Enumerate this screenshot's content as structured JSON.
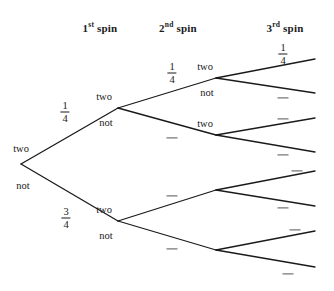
{
  "diagram": {
    "type": "probability-tree",
    "width": 334,
    "height": 291,
    "line_color": "#1a1a1a",
    "text_color": "#1a1a1a",
    "blank_color": "#555555",
    "background": "#ffffff"
  },
  "headers": [
    {
      "id": "h1",
      "ordinal": "1",
      "suffix": "st",
      "word": "spin",
      "x": 100,
      "y": 22
    },
    {
      "id": "h2",
      "ordinal": "2",
      "suffix": "nd",
      "word": "spin",
      "x": 178,
      "y": 22
    },
    {
      "id": "h3",
      "ordinal": "3",
      "suffix": "rd",
      "word": "spin",
      "x": 285,
      "y": 22
    }
  ],
  "nodes": [
    {
      "id": "root",
      "level": 0,
      "x": 21,
      "y": 164,
      "above": "two",
      "below": "not"
    },
    {
      "id": "n-t",
      "level": 1,
      "x": 118,
      "y": 108,
      "above": "two",
      "below": "not"
    },
    {
      "id": "n-n",
      "level": 1,
      "x": 118,
      "y": 221,
      "above": "two",
      "below": "not"
    },
    {
      "id": "n-tt",
      "level": 2,
      "x": 216,
      "y": 78,
      "above": "two",
      "below": "not"
    },
    {
      "id": "n-tn",
      "level": 2,
      "x": 216,
      "y": 135,
      "above": "two",
      "below": ""
    },
    {
      "id": "n-nt",
      "level": 2,
      "x": 216,
      "y": 190,
      "above": "",
      "below": ""
    },
    {
      "id": "n-nn",
      "level": 2,
      "x": 216,
      "y": 250,
      "above": "",
      "below": ""
    }
  ],
  "branches": [
    {
      "id": "b-t",
      "from": "root",
      "x1": 21,
      "y1": 164,
      "x2": 118,
      "y2": 108,
      "label": "1/4",
      "numerator": "1",
      "denominator": "4",
      "lx": 65,
      "ly": 112
    },
    {
      "id": "b-n",
      "from": "root",
      "x1": 21,
      "y1": 164,
      "x2": 118,
      "y2": 221,
      "label": "3/4",
      "numerator": "3",
      "denominator": "4",
      "lx": 66,
      "ly": 218
    },
    {
      "id": "b-tt",
      "from": "n-t",
      "x1": 118,
      "y1": 108,
      "x2": 216,
      "y2": 78,
      "label": "1/4",
      "numerator": "1",
      "denominator": "4",
      "lx": 172,
      "ly": 73
    },
    {
      "id": "b-tn",
      "from": "n-t",
      "x1": 118,
      "y1": 108,
      "x2": 216,
      "y2": 135,
      "label": "",
      "numerator": "",
      "denominator": "",
      "lx": 172,
      "ly": 138
    },
    {
      "id": "b-nt",
      "from": "n-n",
      "x1": 118,
      "y1": 221,
      "x2": 216,
      "y2": 190,
      "label": "",
      "numerator": "",
      "denominator": "",
      "lx": 172,
      "ly": 196
    },
    {
      "id": "b-nn",
      "from": "n-n",
      "x1": 118,
      "y1": 221,
      "x2": 216,
      "y2": 250,
      "label": "",
      "numerator": "",
      "denominator": "",
      "lx": 172,
      "ly": 249
    },
    {
      "id": "b-ttt",
      "from": "n-tt",
      "x1": 216,
      "y1": 78,
      "x2": 315,
      "y2": 59,
      "label": "1/4",
      "numerator": "1",
      "denominator": "4",
      "lx": 283,
      "ly": 54
    },
    {
      "id": "b-ttn",
      "from": "n-tt",
      "x1": 216,
      "y1": 78,
      "x2": 315,
      "y2": 93,
      "label": "",
      "numerator": "",
      "denominator": "",
      "lx": 283,
      "ly": 98
    },
    {
      "id": "b-tnt",
      "from": "n-tn",
      "x1": 216,
      "y1": 135,
      "x2": 315,
      "y2": 118,
      "label": "",
      "numerator": "",
      "denominator": "",
      "lx": 283,
      "ly": 119
    },
    {
      "id": "b-tnn",
      "from": "n-tn",
      "x1": 216,
      "y1": 135,
      "x2": 315,
      "y2": 152,
      "label": "",
      "numerator": "",
      "denominator": "",
      "lx": 283,
      "ly": 155
    },
    {
      "id": "b-ntt",
      "from": "n-nt",
      "x1": 216,
      "y1": 190,
      "x2": 315,
      "y2": 171,
      "label": "",
      "numerator": "",
      "denominator": "",
      "lx": 297,
      "ly": 171
    },
    {
      "id": "b-ntn",
      "from": "n-nt",
      "x1": 216,
      "y1": 190,
      "x2": 315,
      "y2": 206,
      "label": "",
      "numerator": "",
      "denominator": "",
      "lx": 283,
      "ly": 208
    },
    {
      "id": "b-nnt",
      "from": "n-nn",
      "x1": 216,
      "y1": 250,
      "x2": 315,
      "y2": 231,
      "label": "",
      "numerator": "",
      "denominator": "",
      "lx": 295,
      "ly": 230
    },
    {
      "id": "b-nnn",
      "from": "n-nn",
      "x1": 216,
      "y1": 250,
      "x2": 315,
      "y2": 267,
      "label": "",
      "numerator": "",
      "denominator": "",
      "lx": 288,
      "ly": 274
    }
  ],
  "node_label_offsets": {
    "root_above_dx": 0,
    "root_above_dy": -16,
    "root_below_dx": 2,
    "root_below_dy": 21,
    "inner_above_dx": -14,
    "inner_above_dy": -12,
    "inner_below_dx": -12,
    "inner_below_dy": 14,
    "leafcol_above_dx": -11,
    "leafcol_above_dy": -12,
    "leafcol_below_dx": -9,
    "leafcol_below_dy": 14
  }
}
